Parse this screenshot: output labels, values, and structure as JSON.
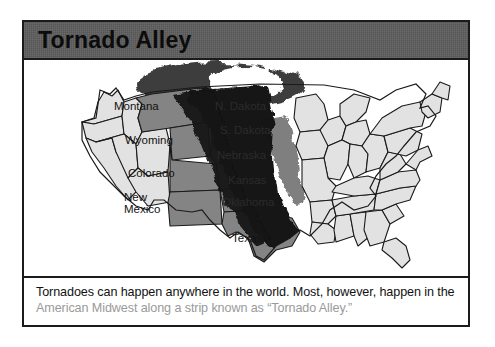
{
  "page": {
    "title": "Tornado Alley",
    "background_color": "#ffffff"
  },
  "card": {
    "border_color": "#1b1b1b",
    "banner_color": "#5c5c5c"
  },
  "map": {
    "name": "united-states-tornado-alley-map",
    "colors": {
      "plain_state_fill": "#e2e2e2",
      "highlight_state_fill": "#848484",
      "alley_band_fill": "#121212",
      "cloud_fill": "#3a3a3a",
      "funnel_hole_fill": "#ffffff",
      "outline": "#1a1a1a"
    },
    "highlighted_states": [
      "Montana",
      "N. Dakota",
      "S. Dakota",
      "Wyoming",
      "Nebraska",
      "Colorado",
      "Kansas",
      "New Mexico",
      "Oklahoma",
      "Texas"
    ],
    "labels": [
      {
        "id": "montana",
        "text": "Montana",
        "x": 90,
        "y": 46,
        "style": "dark"
      },
      {
        "id": "n-dakota",
        "text": "N. Dakota",
        "x": 191,
        "y": 46,
        "style": "onblk"
      },
      {
        "id": "s-dakota",
        "text": "S. Dakota",
        "x": 196,
        "y": 70,
        "style": "onblk"
      },
      {
        "id": "wyoming",
        "text": "Wyoming",
        "x": 101,
        "y": 80,
        "style": "dark"
      },
      {
        "id": "nebraska",
        "text": "Nebraska",
        "x": 193,
        "y": 95,
        "style": "onblk"
      },
      {
        "id": "colorado",
        "text": "Colorado",
        "x": 104,
        "y": 113,
        "style": "dark"
      },
      {
        "id": "kansas",
        "text": "Kansas",
        "x": 204,
        "y": 120,
        "style": "onblk"
      },
      {
        "id": "new-mexico",
        "text": "New\nMexico",
        "x": 100,
        "y": 141,
        "style": "dark"
      },
      {
        "id": "oklahoma",
        "text": "Oklahoma",
        "x": 198,
        "y": 142,
        "style": "onblk"
      },
      {
        "id": "texas",
        "text": "Texas",
        "x": 208,
        "y": 178,
        "style": "dark"
      }
    ]
  },
  "caption": {
    "lead": "Tornadoes can happen anywhere in the world. Most, however, happen in the ",
    "emphasis": "American Midwest along a strip known as “Tornado Alley.”",
    "emphasis_color": "#9a9a9a"
  }
}
